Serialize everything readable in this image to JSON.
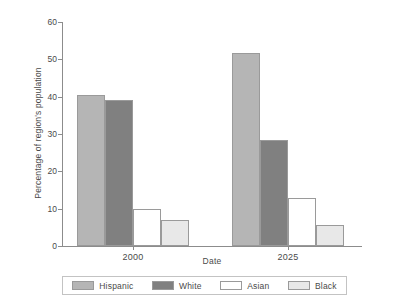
{
  "chart_data": {
    "type": "bar",
    "title": "",
    "xlabel": "Date",
    "ylabel": "Percentage of region's population",
    "categories": [
      "2000",
      "2025"
    ],
    "ylim": [
      0,
      60
    ],
    "yticks": [
      0,
      10,
      20,
      30,
      40,
      50,
      60
    ],
    "ytick_labels": [
      "0",
      "10",
      "20",
      "30",
      "40",
      "50",
      "60"
    ],
    "grid": false,
    "legend_position": "bottom",
    "series": [
      {
        "name": "Hispanic",
        "color": "#b5b5b5",
        "values": [
          40.5,
          51.7
        ]
      },
      {
        "name": "White",
        "color": "#808080",
        "values": [
          39.1,
          28.3
        ]
      },
      {
        "name": "Asian",
        "color": "#ffffff",
        "values": [
          9.9,
          12.8
        ]
      },
      {
        "name": "Black",
        "color": "#e8e8e8",
        "values": [
          7.0,
          5.7
        ]
      }
    ]
  }
}
